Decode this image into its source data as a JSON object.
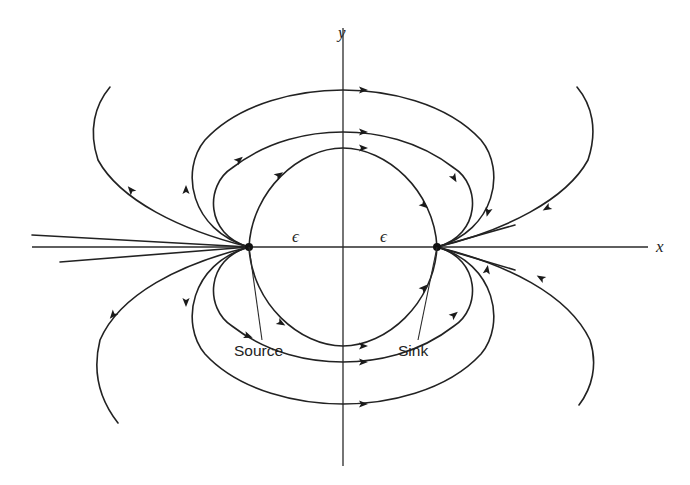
{
  "diagram": {
    "type": "flow-field",
    "colors": {
      "ink": "#222222",
      "background": "#ffffff"
    },
    "axes": {
      "x": {
        "label": "x",
        "from": [
          32,
          247
        ],
        "to": [
          648,
          247
        ],
        "label_pos": [
          656,
          252
        ]
      },
      "y": {
        "label": "y",
        "from": [
          343,
          28
        ],
        "to": [
          343,
          466
        ],
        "label_pos": [
          338,
          20
        ]
      }
    },
    "points": [
      {
        "id": "source",
        "label": "Source",
        "pos": [
          249,
          247
        ],
        "label_pos": [
          234,
          356
        ],
        "leader_to": [
          262,
          340
        ]
      },
      {
        "id": "sink",
        "label": "Sink",
        "pos": [
          437,
          247
        ],
        "label_pos": [
          398,
          356
        ],
        "leader_to": [
          418,
          340
        ]
      }
    ],
    "distance_labels": [
      {
        "text": "ϵ",
        "pos": [
          292,
          242
        ]
      },
      {
        "text": "ϵ",
        "pos": [
          380,
          242
        ]
      }
    ],
    "streamlines": [
      {
        "id": "upper-inner",
        "d": "M249,247 C252,190 300,148 343,148 C386,148 434,190 437,247",
        "arrows": [
          [
            279,
            175,
            -35
          ],
          [
            363,
            148,
            0
          ],
          [
            424,
            205,
            40
          ]
        ]
      },
      {
        "id": "upper-middle",
        "d": "M249,247 C205,235 205,185 232,168 C268,140 310,132 343,132 C376,132 418,140 454,168 C481,185 481,235 437,247",
        "arrows": [
          [
            239,
            160,
            -40
          ],
          [
            363,
            132,
            0
          ],
          [
            454,
            178,
            60
          ]
        ]
      },
      {
        "id": "upper-outer",
        "d": "M249,247 C190,230 180,170 205,140 C240,102 300,90 343,90 C386,90 446,102 481,140 C506,170 496,230 437,247",
        "arrows": [
          [
            186,
            190,
            -90
          ],
          [
            363,
            90,
            0
          ],
          [
            488,
            212,
            105
          ]
        ]
      },
      {
        "id": "lower-inner",
        "d": "M249,247 C252,304 300,346 343,346 C386,346 434,304 437,247",
        "arrows": [
          [
            281,
            323,
            30
          ],
          [
            363,
            346,
            0
          ],
          [
            424,
            288,
            -45
          ]
        ]
      },
      {
        "id": "lower-middle",
        "d": "M249,247 C205,259 205,309 232,326 C268,354 310,362 343,362 C376,362 418,354 454,326 C481,309 481,259 437,247",
        "arrows": [
          [
            248,
            336,
            20
          ],
          [
            363,
            362,
            0
          ],
          [
            454,
            315,
            -40
          ]
        ]
      },
      {
        "id": "lower-outer",
        "d": "M249,247 C190,264 180,324 205,354 C240,392 300,404 343,404 C386,404 446,392 481,354 C506,324 496,264 437,247",
        "arrows": [
          [
            186,
            302,
            90
          ],
          [
            363,
            404,
            0
          ],
          [
            487,
            270,
            -80
          ]
        ]
      },
      {
        "id": "far-upper-left",
        "d": "M249,247 C180,230 120,200 98,160 C88,130 95,105 110,87",
        "arrows": [
          [
            131,
            190,
            -130
          ]
        ]
      },
      {
        "id": "far-lower-left",
        "d": "M249,247 C180,264 120,294 100,340 C92,372 100,400 118,423",
        "arrows": [
          [
            113,
            315,
            130
          ]
        ]
      },
      {
        "id": "far-upper-right",
        "d": "M437,247 C506,230 566,200 588,160 C598,130 592,105 577,87",
        "arrows": [
          [
            547,
            208,
            150
          ]
        ]
      },
      {
        "id": "far-lower-right",
        "d": "M437,247 C506,264 568,294 590,340 C598,365 592,388 579,405",
        "arrows": [
          [
            541,
            278,
            -150
          ]
        ]
      },
      {
        "id": "fan-upper-left",
        "d": "M249,247 L32,235",
        "arrows": []
      },
      {
        "id": "fan-lower-left",
        "d": "M249,247 L60,262",
        "arrows": []
      },
      {
        "id": "fan-upper-right",
        "d": "M437,247 L515,225",
        "arrows": []
      },
      {
        "id": "fan-lower-right",
        "d": "M437,247 L515,270",
        "arrows": []
      }
    ]
  }
}
